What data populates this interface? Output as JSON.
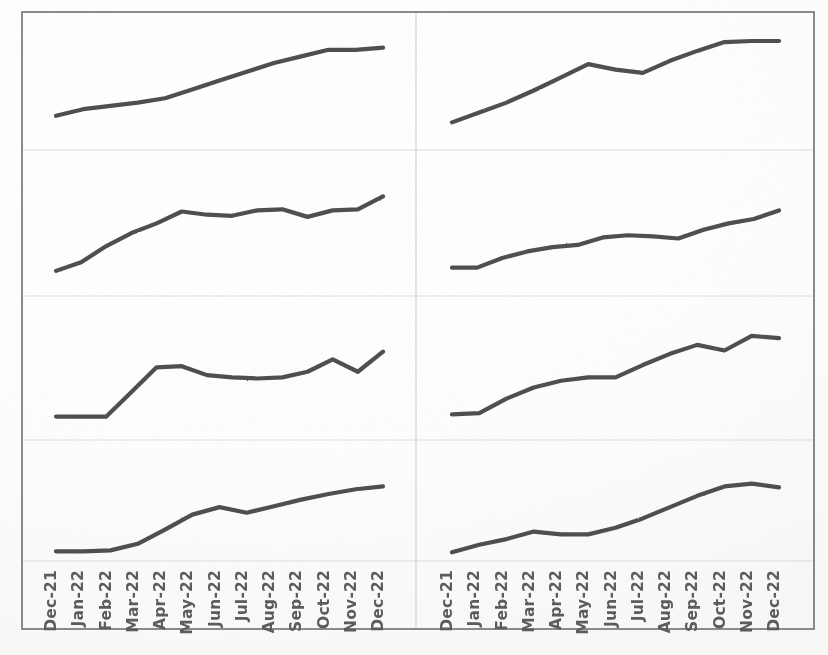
{
  "figure": {
    "kind": "small-multiples-line-panel",
    "panel_rows": 4,
    "panel_cols": 2,
    "frame_color": "#6f6f6f",
    "gridline_color": "#d9d9d9",
    "divider_color": "#d9d9d9",
    "line_color": "#4f4f4f",
    "background_color": "#fdfdfc",
    "label_color": "#5b5b5b"
  },
  "axis": {
    "orientation": "vertical-rotated",
    "rotation_degrees": -90,
    "tick_labels": [
      "Dec-21",
      "Jan-22",
      "Feb-22",
      "Mar-22",
      "Apr-22",
      "May-22",
      "Jun-22",
      "Jul-22",
      "Aug-22",
      "Sep-22",
      "Oct-22",
      "Nov-22",
      "Dec-22"
    ]
  },
  "chart_data": {
    "type": "line",
    "title": "",
    "xlabel": "",
    "ylabel": "",
    "grid": true,
    "legend": "none",
    "x": [
      "Dec-21",
      "Jan-22",
      "Feb-22",
      "Mar-22",
      "Apr-22",
      "May-22",
      "Jun-22",
      "Jul-22",
      "Aug-22",
      "Sep-22",
      "Oct-22",
      "Nov-22",
      "Dec-22"
    ],
    "ylim": [
      0,
      100
    ],
    "panels": [
      {
        "position": "row-1-left",
        "row": 1,
        "col": 1,
        "name": "panel-top-left",
        "series": [
          {
            "name": "series-1",
            "values": [
              22,
              28,
              31,
              34,
              38,
              46,
              54,
              62,
              70,
              76,
              82,
              82,
              84
            ]
          }
        ]
      },
      {
        "position": "row-1-right",
        "row": 1,
        "col": 2,
        "name": "panel-top-right",
        "series": [
          {
            "name": "series-2",
            "values": [
              16,
              25,
              34,
              45,
              57,
              69,
              64,
              61,
              72,
              81,
              89,
              90,
              90
            ]
          }
        ]
      },
      {
        "position": "row-2-left",
        "row": 2,
        "col": 1,
        "name": "panel-second-left",
        "series": [
          {
            "name": "series-3",
            "values": [
              14,
              22,
              37,
              49,
              58,
              69,
              66,
              65,
              70,
              71,
              64,
              70,
              71,
              83
            ]
          }
        ]
      },
      {
        "position": "row-2-right",
        "row": 2,
        "col": 2,
        "name": "panel-second-right",
        "series": [
          {
            "name": "series-4",
            "values": [
              17,
              17,
              26,
              32,
              36,
              38,
              45,
              47,
              46,
              44,
              52,
              58,
              62,
              70
            ]
          }
        ]
      },
      {
        "position": "row-3-left",
        "row": 3,
        "col": 1,
        "name": "panel-third-left",
        "series": [
          {
            "name": "series-5",
            "values": [
              12,
              12,
              12,
              34,
              56,
              57,
              49,
              47,
              46,
              47,
              52,
              63,
              52,
              70
            ]
          }
        ]
      },
      {
        "position": "row-3-right",
        "row": 3,
        "col": 2,
        "name": "panel-third-right",
        "series": [
          {
            "name": "series-6",
            "values": [
              14,
              15,
              28,
              38,
              44,
              47,
              47,
              58,
              68,
              76,
              71,
              84,
              82
            ]
          }
        ]
      },
      {
        "position": "row-4-left",
        "row": 4,
        "col": 1,
        "name": "panel-bottom-left",
        "series": [
          {
            "name": "series-7",
            "values": [
              5,
              5,
              6,
              13,
              28,
              44,
              52,
              46,
              53,
              60,
              66,
              71,
              74
            ]
          }
        ]
      },
      {
        "position": "row-4-right",
        "row": 4,
        "col": 2,
        "name": "panel-bottom-right",
        "series": [
          {
            "name": "series-8",
            "values": [
              4,
              12,
              18,
              26,
              23,
              23,
              30,
              40,
              52,
              64,
              74,
              77,
              73
            ]
          }
        ]
      }
    ]
  }
}
